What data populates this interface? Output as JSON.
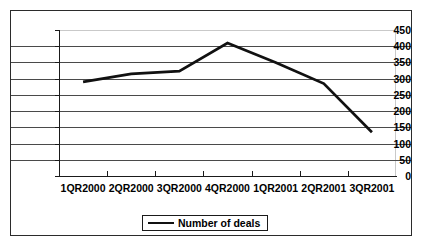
{
  "chart_data": {
    "type": "line",
    "title": "",
    "xlabel": "",
    "ylabel": "",
    "categories": [
      "1QR2000",
      "2QR2000",
      "3QR2000",
      "4QR2000",
      "1QR2001",
      "2QR2001",
      "3QR2001"
    ],
    "series": [
      {
        "name": "Number of deals",
        "values": [
          290,
          315,
          323,
          410,
          350,
          285,
          135
        ],
        "color": "#111111"
      }
    ],
    "ylim": [
      0,
      450
    ],
    "ytick_step": 50,
    "yticks": [
      450,
      400,
      350,
      300,
      250,
      200,
      150,
      100,
      50,
      0
    ],
    "grid": true,
    "grid_axis": "y",
    "legend_position": "bottom",
    "legend_entries": [
      "Number of deals"
    ],
    "frame_color": "#2b2b2b",
    "gridline_color": "#4a4a4a"
  },
  "legend": {
    "label": "Number of deals",
    "swatch_name": "line-swatch"
  }
}
